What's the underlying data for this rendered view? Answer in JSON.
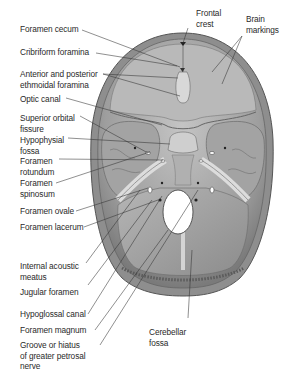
{
  "figure": {
    "colors": {
      "background": "#ffffff",
      "bone_outer": "#8a8a8a",
      "bone_surface": "#a8a8a8",
      "bone_light": "#c9c9c9",
      "bone_dark": "#5a5a5a",
      "foramen_magnum": "#ffffff",
      "text": "#2a2a2a",
      "leader_line": "#333333"
    },
    "labels_left": [
      {
        "id": "foramen-cecum",
        "lines": [
          "Foramen cecum"
        ]
      },
      {
        "id": "cribriform-foramina",
        "lines": [
          "Cribriform foramina"
        ]
      },
      {
        "id": "anterior-posterior-ethmoidal-foramina",
        "lines": [
          "Anterior and posterior",
          "ethmoidal foramina"
        ]
      },
      {
        "id": "optic-canal",
        "lines": [
          "Optic canal"
        ]
      },
      {
        "id": "superior-orbital-fissure",
        "lines": [
          "Superior orbital",
          "fissure"
        ]
      },
      {
        "id": "hypophysial-fossa",
        "lines": [
          "Hypophysial",
          "fossa"
        ]
      },
      {
        "id": "foramen-rotundum",
        "lines": [
          "Foramen",
          "rotundum"
        ]
      },
      {
        "id": "foramen-spinosum",
        "lines": [
          "Foramen",
          "spinosum"
        ]
      },
      {
        "id": "foramen-ovale",
        "lines": [
          "Foramen ovale"
        ]
      },
      {
        "id": "foramen-lacerum",
        "lines": [
          "Foramen lacerum"
        ]
      },
      {
        "id": "internal-acoustic-meatus",
        "lines": [
          "Internal acoustic",
          "meatus"
        ]
      },
      {
        "id": "jugular-foramen",
        "lines": [
          "Jugular foramen"
        ]
      },
      {
        "id": "hypoglossal-canal",
        "lines": [
          "Hypoglossal canal"
        ]
      },
      {
        "id": "foramen-magnum",
        "lines": [
          "Foramen magnum"
        ]
      },
      {
        "id": "groove-hiatus-greater-petrosal-nerve",
        "lines": [
          "Groove or hiatus",
          "of greater petrosal",
          "nerve"
        ]
      }
    ],
    "labels_top": [
      {
        "id": "frontal-crest",
        "lines": [
          "Frontal",
          "crest"
        ]
      },
      {
        "id": "brain-markings",
        "lines": [
          "Brain",
          "markings"
        ]
      }
    ],
    "labels_bottom": [
      {
        "id": "cerebellar-fossa",
        "lines": [
          "Cerebellar",
          "fossa"
        ]
      }
    ]
  }
}
